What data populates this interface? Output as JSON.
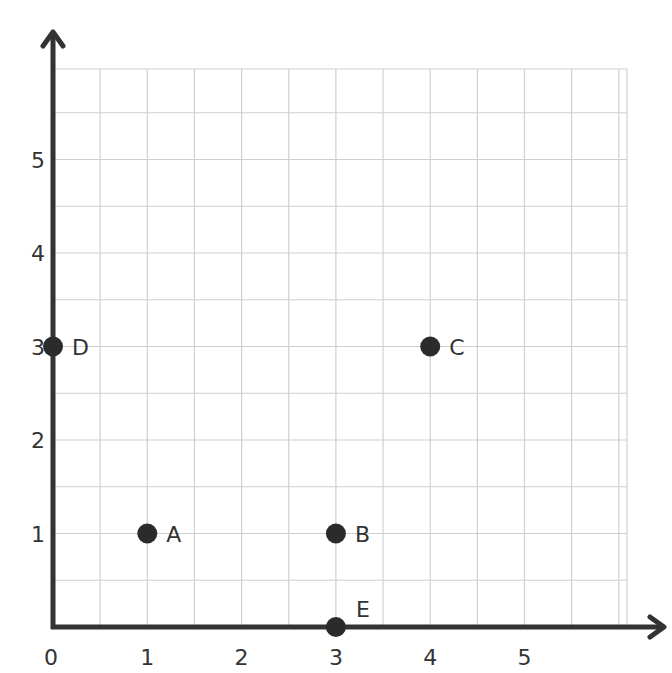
{
  "chart_data": {
    "type": "scatter",
    "title": "",
    "xlabel": "",
    "ylabel": "",
    "xlim": [
      0,
      6
    ],
    "ylim": [
      0,
      6
    ],
    "grid": true,
    "grid_step": 0.5,
    "x_ticks": [
      "0",
      "1",
      "2",
      "3",
      "4",
      "5"
    ],
    "y_ticks": [
      "1",
      "2",
      "3",
      "4",
      "5"
    ],
    "points": [
      {
        "label": "A",
        "x": 1,
        "y": 1
      },
      {
        "label": "B",
        "x": 3,
        "y": 1
      },
      {
        "label": "C",
        "x": 4,
        "y": 3
      },
      {
        "label": "D",
        "x": 0,
        "y": 3
      },
      {
        "label": "E",
        "x": 3,
        "y": 0
      }
    ]
  },
  "colors": {
    "axis": "#333333",
    "grid": "#cfcfcf",
    "point": "#2b2b2b",
    "text": "#333333"
  }
}
